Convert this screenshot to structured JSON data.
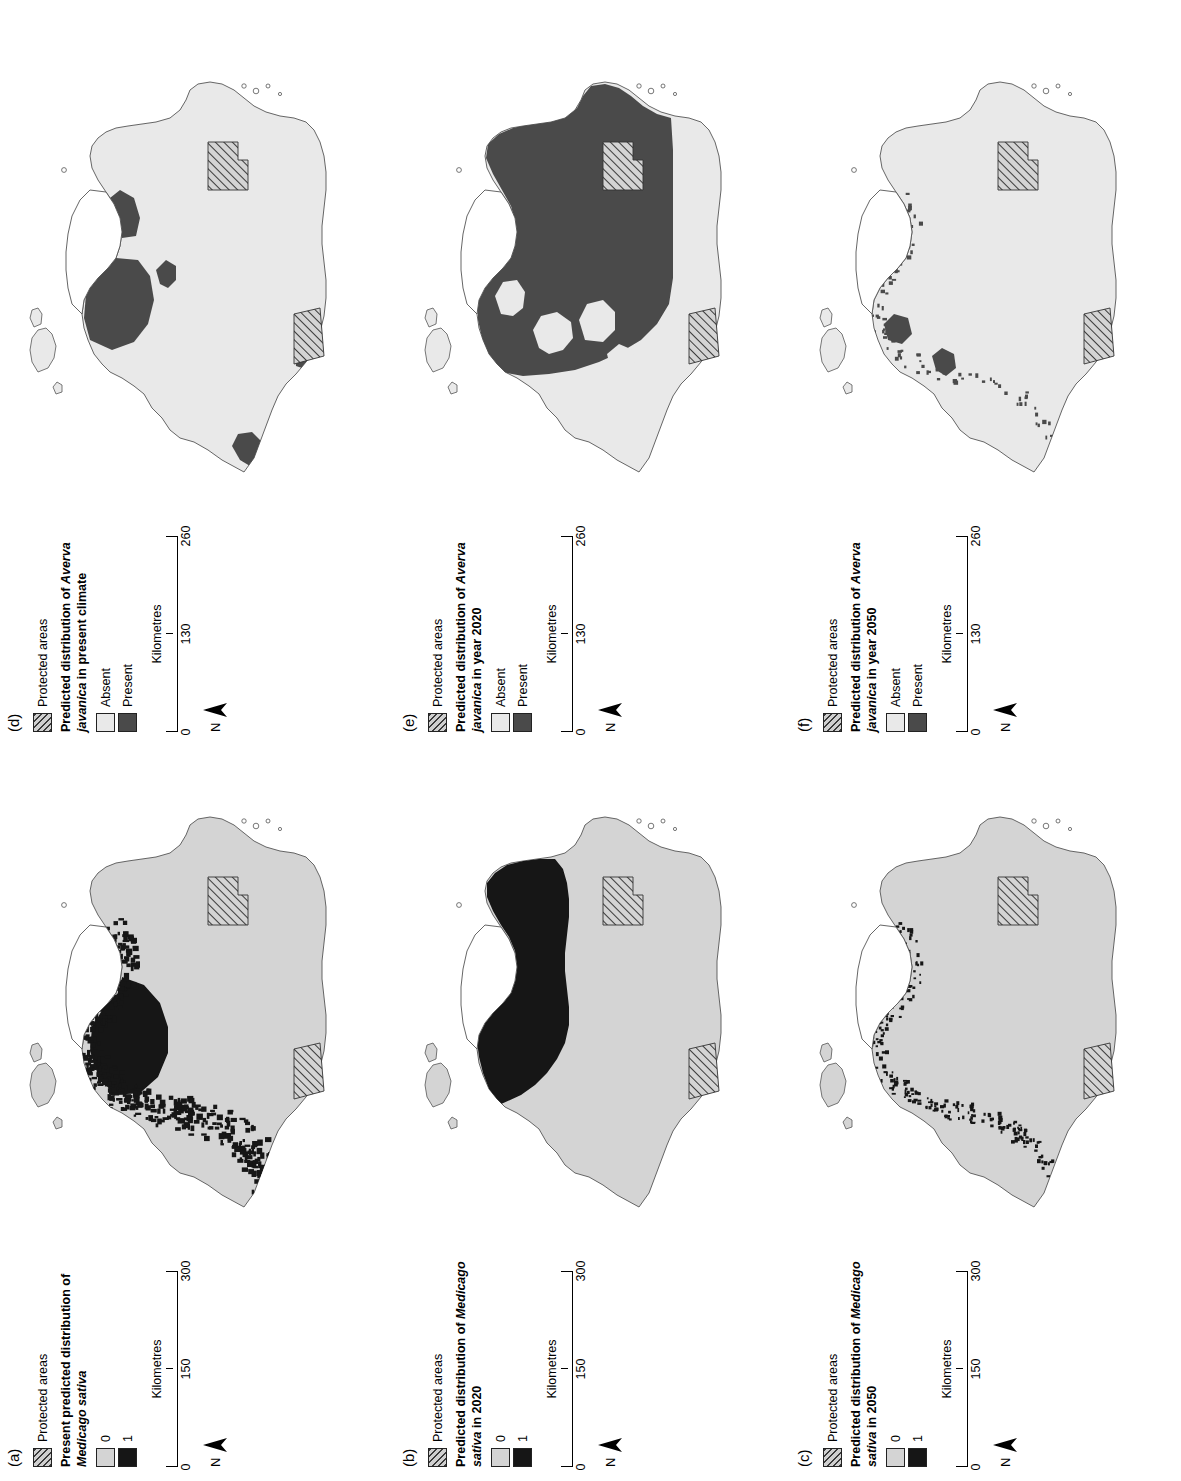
{
  "figure": {
    "orientation": "rotated-90-ccw",
    "species": [
      "Medicago sativa",
      "Averva javanica"
    ],
    "region": "Libya"
  },
  "colors": {
    "absent_light": "#e9e9e9",
    "absent_grey": "#d4d4d4",
    "present_black": "#161616",
    "present_dark_grey": "#4a4a4a",
    "protected_hatch": "#3a3a3a",
    "coastline": "#555555",
    "background": "#ffffff"
  },
  "panels": [
    {
      "id": "a",
      "letter": "(a)",
      "protected_label": "Protected areas",
      "title_line1": "Present predicted distribution of",
      "title_line2": "Medicago sativa",
      "title_italic_part": "Medicago sativa",
      "classes": [
        {
          "label": "0",
          "swatch": "absent-grey"
        },
        {
          "label": "1",
          "swatch": "present-black"
        }
      ],
      "scale": {
        "unit": "Kilometres",
        "ticks": [
          "0",
          "150",
          "300"
        ]
      },
      "north_label": "N",
      "presence_style": "speckled",
      "presence_amount": "high"
    },
    {
      "id": "b",
      "letter": "(b)",
      "protected_label": "Protected areas",
      "title_line1": "Predicted distribution of Medicago",
      "title_line2": "sativa in 2020",
      "title_italic_part": "Medicago",
      "classes": [
        {
          "label": "0",
          "swatch": "absent-grey"
        },
        {
          "label": "1",
          "swatch": "present-black"
        }
      ],
      "scale": {
        "unit": "Kilometres",
        "ticks": [
          "0",
          "150",
          "300"
        ]
      },
      "north_label": "N",
      "presence_style": "solid",
      "presence_amount": "high"
    },
    {
      "id": "c",
      "letter": "(c)",
      "protected_label": "Protected areas",
      "title_line1": "Predicted distribution of Medicago",
      "title_line2": "sativa in 2050",
      "title_italic_part": "Medicago",
      "classes": [
        {
          "label": "0",
          "swatch": "absent-grey"
        },
        {
          "label": "1",
          "swatch": "present-black"
        }
      ],
      "scale": {
        "unit": "Kilometres",
        "ticks": [
          "0",
          "150",
          "300"
        ]
      },
      "north_label": "N",
      "presence_style": "speckled",
      "presence_amount": "low"
    },
    {
      "id": "d",
      "letter": "(d)",
      "protected_label": "Protected areas",
      "title_line1": "Predicted distribution of Averva",
      "title_line2": "javanica in present climate",
      "title_italic_part": "Averva javanica",
      "classes": [
        {
          "label": "Absent",
          "swatch": "absent-light"
        },
        {
          "label": "Present",
          "swatch": "present-dark"
        }
      ],
      "scale": {
        "unit": "Kilometres",
        "ticks": [
          "0",
          "130",
          "260"
        ]
      },
      "north_label": "N",
      "presence_style": "patchy",
      "presence_amount": "medium"
    },
    {
      "id": "e",
      "letter": "(e)",
      "protected_label": "Protected areas",
      "title_line1": "Predicted distribution of Averva",
      "title_line2": "javanica in year 2020",
      "title_italic_part": "Averva javanica",
      "classes": [
        {
          "label": "Absent",
          "swatch": "absent-light"
        },
        {
          "label": "Present",
          "swatch": "present-dark"
        }
      ],
      "scale": {
        "unit": "Kilometres",
        "ticks": [
          "0",
          "130",
          "260"
        ]
      },
      "north_label": "N",
      "presence_style": "broad",
      "presence_amount": "very-high"
    },
    {
      "id": "f",
      "letter": "(f)",
      "protected_label": "Protected areas",
      "title_line1": "Predicted distribution of Averva",
      "title_line2": "javanica in year 2050",
      "title_italic_part": "Averva javanica",
      "classes": [
        {
          "label": "Absent",
          "swatch": "absent-light"
        },
        {
          "label": "Present",
          "swatch": "present-dark"
        }
      ],
      "scale": {
        "unit": "Kilometres",
        "ticks": [
          "0",
          "130",
          "260"
        ]
      },
      "north_label": "N",
      "presence_style": "sparse",
      "presence_amount": "very-low"
    }
  ]
}
